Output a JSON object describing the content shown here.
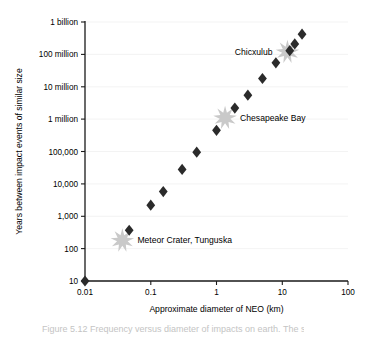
{
  "figure": {
    "caption_partial": "Figure 5.12   Frequency versus diameter of impacts on earth. The sizes"
  },
  "chart_data": {
    "type": "scatter",
    "title": "",
    "xlabel": "Approximate diameter of NEO (km)",
    "ylabel": "Years between impact events of similar size",
    "xscale": "log",
    "yscale": "log",
    "xlim": [
      0.01,
      100
    ],
    "ylim": [
      10,
      1000000000
    ],
    "grid": false,
    "legend": "none",
    "xticks": [
      0.01,
      0.1,
      1,
      10,
      100
    ],
    "xtick_labels": [
      "0.01",
      "0.1",
      "1",
      "10",
      "100"
    ],
    "yticks": [
      10,
      100,
      1000,
      10000,
      100000,
      1000000,
      10000000,
      100000000,
      1000000000
    ],
    "ytick_labels": [
      "10",
      "100",
      "1,000",
      "10,000",
      "100,000",
      "1 million",
      "10 million",
      "100 million",
      "1 billion"
    ],
    "series": [
      {
        "name": "Impact events",
        "marker": "diamond",
        "color": "#2b2b2b",
        "points": [
          {
            "x": 0.01,
            "y": 10
          },
          {
            "x": 0.047,
            "y": 370
          },
          {
            "x": 0.1,
            "y": 2200
          },
          {
            "x": 0.155,
            "y": 5800
          },
          {
            "x": 0.3,
            "y": 28000
          },
          {
            "x": 0.5,
            "y": 95000
          },
          {
            "x": 1.0,
            "y": 450000
          },
          {
            "x": 1.9,
            "y": 2200000
          },
          {
            "x": 3.0,
            "y": 5500000
          },
          {
            "x": 5.0,
            "y": 18000000
          },
          {
            "x": 8.0,
            "y": 55000000
          },
          {
            "x": 13.0,
            "y": 130000000
          },
          {
            "x": 15.5,
            "y": 210000000
          },
          {
            "x": 20.0,
            "y": 420000000
          }
        ]
      }
    ],
    "annotations": [
      {
        "label": "Meteor Crater, Tunguska",
        "x": 0.037,
        "y": 180,
        "marker": "starburst",
        "color": "#c9c9c9",
        "label_position": "right"
      },
      {
        "label": "Chesapeake Bay",
        "x": 1.35,
        "y": 1100000,
        "marker": "starburst",
        "color": "#c9c9c9",
        "label_position": "right"
      },
      {
        "label": "Chicxulub",
        "x": 12.0,
        "y": 120000000,
        "marker": "starburst",
        "color": "#c9c9c9",
        "label_position": "left"
      }
    ]
  }
}
